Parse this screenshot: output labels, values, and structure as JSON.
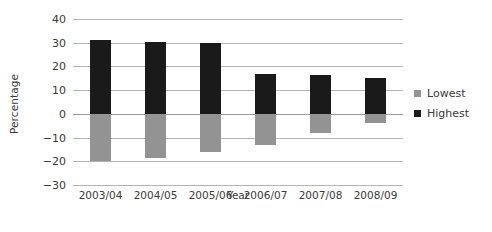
{
  "chart_data": {
    "type": "bar",
    "title": "",
    "subtitle": "",
    "xlabel": "Year",
    "ylabel": "Percentage",
    "categories": [
      "2003/04",
      "2004/05",
      "2005/06",
      "2006/07",
      "2007/08",
      "2008/09"
    ],
    "series": [
      {
        "name": "Lowest",
        "color": "#939393",
        "values": [
          -20,
          -18.5,
          -16,
          -13,
          -8,
          -4
        ]
      },
      {
        "name": "Highest",
        "color": "#1a1a1a",
        "values": [
          31,
          30.5,
          30,
          17,
          16.5,
          15
        ]
      }
    ],
    "ylim": [
      -30,
      40
    ],
    "ytick_labels": [
      "40",
      "30",
      "20",
      "10",
      "0",
      "-10",
      "-20",
      "-30"
    ],
    "ytick_values": [
      40,
      30,
      20,
      10,
      0,
      -10,
      -20,
      -30
    ],
    "ytick_step": 10,
    "grid": true,
    "grid_color": "#b4b4b4",
    "zero_line_color": "#9a9a9a",
    "background_color": "#ffffff",
    "legend_position": "right",
    "orientation": "vertical",
    "bar_style": "floating-range"
  }
}
